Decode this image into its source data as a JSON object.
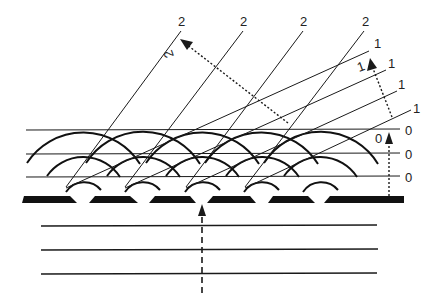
{
  "diagram": {
    "type": "diffraction-grating-wavefronts",
    "colors": {
      "ink": "#1a1a1a",
      "background": "#ffffff"
    },
    "order_labels": {
      "order2": [
        "2",
        "2",
        "2",
        "2"
      ],
      "order2_direction": "2",
      "order1": [
        "1",
        "1",
        "1",
        "1"
      ],
      "order1_direction": "1",
      "order0": [
        "0",
        "0",
        "0"
      ],
      "order0_direction": "0"
    },
    "grating": {
      "slit_bars": 6,
      "gaps": 5
    },
    "incident_wavefronts": 3,
    "zeroth_order_wavefronts": 3,
    "arcs_per_gap": 3
  }
}
